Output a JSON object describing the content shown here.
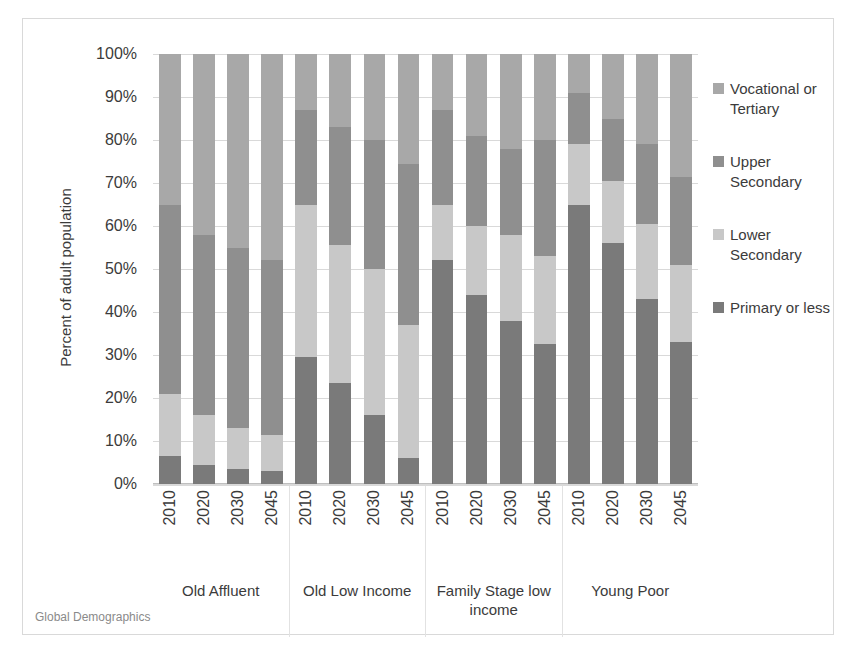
{
  "footer": {
    "source": "Global Demographics"
  },
  "legend": {
    "position": "right",
    "items": [
      {
        "label": "Vocational or Tertiary",
        "color": "#a8a8a8"
      },
      {
        "label": "Upper Secondary",
        "color": "#8f8f8f"
      },
      {
        "label": "Lower Secondary",
        "color": "#c8c8c8"
      },
      {
        "label": "Primary or less",
        "color": "#7a7a7a"
      }
    ]
  },
  "chart_data": {
    "type": "bar",
    "subtype": "stacked-100-percent",
    "title": "",
    "xlabel": "",
    "ylabel": "Percent of adult population",
    "ylim": [
      0,
      100
    ],
    "ytick_labels": [
      "0%",
      "10%",
      "20%",
      "30%",
      "40%",
      "50%",
      "60%",
      "70%",
      "80%",
      "90%",
      "100%"
    ],
    "ytick_values": [
      0,
      10,
      20,
      30,
      40,
      50,
      60,
      70,
      80,
      90,
      100
    ],
    "grid": true,
    "groups": [
      "Old Affluent",
      "Old Low Income",
      "Family Stage low income",
      "Young Poor"
    ],
    "categories": [
      "2010",
      "2020",
      "2030",
      "2045"
    ],
    "series": [
      {
        "name": "Primary or less",
        "color": "#7a7a7a",
        "values": {
          "Old Affluent": [
            6.5,
            4.5,
            3.5,
            3.0
          ],
          "Old Low Income": [
            29.5,
            23.5,
            16.0,
            6.0
          ],
          "Family Stage low income": [
            52.0,
            44.0,
            38.0,
            32.5
          ],
          "Young Poor": [
            65.0,
            56.0,
            43.0,
            33.0
          ]
        }
      },
      {
        "name": "Lower Secondary",
        "color": "#c8c8c8",
        "values": {
          "Old Affluent": [
            14.5,
            11.5,
            9.5,
            8.5
          ],
          "Old Low Income": [
            35.5,
            32.0,
            34.0,
            31.0
          ],
          "Family Stage low income": [
            13.0,
            16.0,
            20.0,
            20.5
          ],
          "Young Poor": [
            14.0,
            14.5,
            17.5,
            18.0
          ]
        }
      },
      {
        "name": "Upper Secondary",
        "color": "#8f8f8f",
        "values": {
          "Old Affluent": [
            44.0,
            42.0,
            42.0,
            40.5
          ],
          "Old Low Income": [
            22.0,
            27.5,
            30.0,
            37.5
          ],
          "Family Stage low income": [
            22.0,
            21.0,
            20.0,
            27.0
          ],
          "Young Poor": [
            12.0,
            14.5,
            18.5,
            20.5
          ]
        }
      },
      {
        "name": "Vocational or Tertiary",
        "color": "#a8a8a8",
        "values": {
          "Old Affluent": [
            35.0,
            42.0,
            45.0,
            48.0
          ],
          "Old Low Income": [
            13.0,
            17.0,
            20.0,
            25.5
          ],
          "Family Stage low income": [
            13.0,
            19.0,
            22.0,
            20.0
          ],
          "Young Poor": [
            9.0,
            15.0,
            21.0,
            28.5
          ]
        }
      }
    ]
  }
}
